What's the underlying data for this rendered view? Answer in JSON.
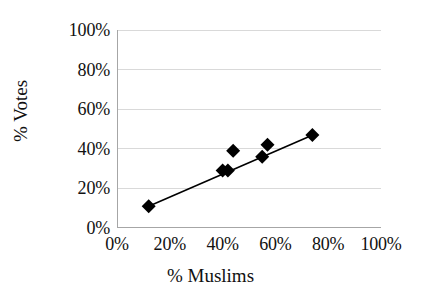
{
  "chart_data": {
    "type": "scatter",
    "title": "",
    "xlabel": "% Muslims",
    "ylabel": "% Votes",
    "xlim": [
      0,
      100
    ],
    "ylim": [
      0,
      100
    ],
    "xticks": [
      "0%",
      "20%",
      "40%",
      "60%",
      "80%",
      "100%"
    ],
    "yticks": [
      "0%",
      "20%",
      "40%",
      "60%",
      "80%",
      "100%"
    ],
    "xtick_values": [
      0,
      20,
      40,
      60,
      80,
      100
    ],
    "ytick_values": [
      0,
      20,
      40,
      60,
      80,
      100
    ],
    "grid": "horizontal",
    "legend": "none",
    "marker": "diamond",
    "marker_color": "#000000",
    "gridline_color": "#d9d9d9",
    "axis_color": "#a6a6a6",
    "trendline_color": "#000000",
    "points": [
      {
        "x": 12,
        "y": 11
      },
      {
        "x": 40,
        "y": 29
      },
      {
        "x": 42,
        "y": 29
      },
      {
        "x": 44,
        "y": 39
      },
      {
        "x": 55,
        "y": 36
      },
      {
        "x": 57,
        "y": 42
      },
      {
        "x": 74,
        "y": 47
      }
    ],
    "trendline": {
      "x0": 12,
      "y0": 11,
      "x1": 75,
      "y1": 47.5
    }
  }
}
